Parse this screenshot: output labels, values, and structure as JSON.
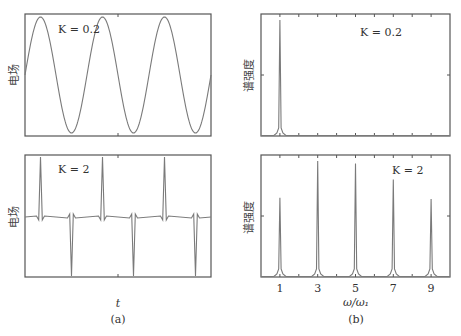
{
  "figure": {
    "panel_a_caption": "(a)",
    "panel_b_caption": "(b)",
    "panel_a_xlabel": "t",
    "panel_b_xlabel": "ω/ω₁"
  },
  "chart_data": [
    {
      "type": "line",
      "panel": "a-top",
      "title": "",
      "annotation": "K = 0.2",
      "ylabel": "电场",
      "xlabel": "",
      "description": "Near-sinusoidal electric field, ~3 periods",
      "periods": 3,
      "x": [
        0,
        0.25,
        0.5,
        0.75,
        1,
        1.25,
        1.5,
        1.75,
        2,
        2.25,
        2.5,
        2.75,
        3
      ],
      "values": [
        0,
        1,
        0,
        -1,
        0,
        1,
        0,
        -1,
        0,
        1,
        0,
        -1,
        0
      ],
      "grid": false
    },
    {
      "type": "line",
      "panel": "a-bottom",
      "annotation": "K = 2",
      "ylabel": "电场",
      "xlabel": "t",
      "description": "Spiky field: alternating positive and negative sharp pulses on a flat baseline",
      "pulse_times": [
        0.25,
        0.75,
        1.25,
        1.75,
        2.25,
        2.75
      ],
      "pulse_signs": [
        1,
        -1,
        1,
        -1,
        1,
        -1
      ],
      "baseline": 0,
      "grid": false
    },
    {
      "type": "line",
      "panel": "b-top",
      "annotation": "K = 0.2",
      "ylabel": "谱强度",
      "xlabel": "",
      "xlim": [
        0,
        10
      ],
      "peaks": [
        {
          "x": 1,
          "height": 0.95
        }
      ],
      "grid": false
    },
    {
      "type": "line",
      "panel": "b-bottom",
      "annotation": "K = 2",
      "ylabel": "谱强度",
      "xlabel": "ω/ω₁",
      "xlim": [
        0,
        10
      ],
      "xticks": [
        1,
        3,
        5,
        7,
        9
      ],
      "categories": [
        "1",
        "3",
        "5",
        "7",
        "9"
      ],
      "values": [
        0.65,
        0.95,
        0.93,
        0.8,
        0.64
      ],
      "grid": false
    }
  ],
  "labels": {
    "k_a_top": "K = 0.2",
    "k_a_bottom": "K = 2",
    "k_b_top": "K = 0.2",
    "k_b_bottom": "K = 2",
    "ylabel_field": "电场",
    "ylabel_spectrum": "谱强度",
    "xticks": [
      "1",
      "3",
      "5",
      "7",
      "9"
    ]
  }
}
